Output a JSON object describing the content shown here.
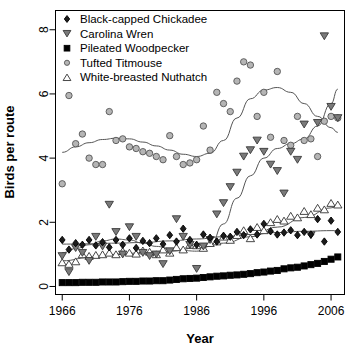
{
  "chart_data": {
    "type": "scatter",
    "title": "",
    "xlabel": "Year",
    "ylabel": "Birds per route",
    "xlim": [
      1965,
      2008
    ],
    "ylim": [
      -0.25,
      8.6
    ],
    "xticks": [
      1966,
      1976,
      1986,
      1996,
      2006
    ],
    "xticklabels": [
      "1966",
      "1976",
      "1986",
      "1996",
      "2006"
    ],
    "yticks": [
      0,
      2,
      4,
      6,
      8
    ],
    "yticklabels": [
      "0",
      "2",
      "4",
      "6",
      "8"
    ],
    "grid": false,
    "legend_position": "top-left",
    "legend": [
      {
        "label": "Black-capped Chickadee",
        "marker": "filled-diamond",
        "color": "#1a1a1a"
      },
      {
        "label": "Carolina Wren",
        "marker": "filled-down-triangle",
        "color": "#666666"
      },
      {
        "label": "Pileated Woodpecker",
        "marker": "filled-square",
        "color": "#000000"
      },
      {
        "label": "Tufted Titmouse",
        "marker": "open-circle",
        "color": "#9a9a9a"
      },
      {
        "label": "White-breasted Nuthatch",
        "marker": "open-up-triangle",
        "color": "#ffffff"
      }
    ],
    "series": [
      {
        "name": "Black-capped Chickadee",
        "marker": "filled-diamond",
        "fill": "#1c1c1c",
        "stroke": "#000000",
        "x": [
          1966,
          1967,
          1968,
          1969,
          1970,
          1971,
          1972,
          1973,
          1974,
          1975,
          1976,
          1977,
          1978,
          1979,
          1980,
          1981,
          1982,
          1983,
          1984,
          1985,
          1986,
          1987,
          1988,
          1989,
          1990,
          1991,
          1992,
          1993,
          1994,
          1995,
          1996,
          1997,
          1998,
          1999,
          2000,
          2001,
          2002,
          2003,
          2004,
          2005,
          2006,
          2007
        ],
        "y": [
          1.45,
          1.15,
          1.35,
          1.3,
          1.45,
          1.28,
          1.38,
          1.22,
          1.45,
          1.3,
          1.5,
          1.2,
          1.42,
          1.35,
          1.5,
          1.32,
          1.6,
          1.4,
          1.8,
          1.45,
          1.3,
          1.62,
          1.52,
          1.4,
          1.58,
          1.55,
          1.7,
          1.6,
          1.78,
          1.62,
          1.95,
          1.72,
          1.62,
          1.68,
          1.75,
          1.6,
          1.7,
          1.62,
          2.1,
          1.4,
          2.05,
          1.7
        ]
      },
      {
        "name": "Carolina Wren",
        "marker": "filled-down-triangle",
        "fill": "#7a7a7a",
        "stroke": "#3a3a3a",
        "x": [
          1966,
          1967,
          1968,
          1969,
          1970,
          1971,
          1972,
          1973,
          1974,
          1975,
          1976,
          1977,
          1978,
          1979,
          1980,
          1981,
          1982,
          1983,
          1984,
          1985,
          1986,
          1987,
          1988,
          1989,
          1990,
          1991,
          1992,
          1993,
          1994,
          1995,
          1996,
          1997,
          1998,
          1999,
          2000,
          2001,
          2002,
          2003,
          2004,
          2005,
          2006,
          2007
        ],
        "y": [
          0.95,
          0.45,
          1.2,
          1.05,
          0.8,
          1.55,
          1.25,
          2.55,
          1.7,
          1.0,
          1.85,
          1.55,
          1.05,
          0.95,
          1.0,
          0.7,
          1.1,
          2.1,
          1.55,
          1.3,
          0.55,
          1.25,
          1.45,
          2.25,
          2.6,
          3.1,
          3.55,
          4.05,
          4.25,
          4.55,
          4.2,
          3.8,
          3.6,
          2.9,
          4.2,
          3.95,
          5.05,
          1.6,
          5.1,
          7.8,
          5.6,
          5.25
        ]
      },
      {
        "name": "Pileated Woodpecker",
        "marker": "filled-square",
        "fill": "#000000",
        "stroke": "#000000",
        "x": [
          1966,
          1967,
          1968,
          1969,
          1970,
          1971,
          1972,
          1973,
          1974,
          1975,
          1976,
          1977,
          1978,
          1979,
          1980,
          1981,
          1982,
          1983,
          1984,
          1985,
          1986,
          1987,
          1988,
          1989,
          1990,
          1991,
          1992,
          1993,
          1994,
          1995,
          1996,
          1997,
          1998,
          1999,
          2000,
          2001,
          2002,
          2003,
          2004,
          2005,
          2006,
          2007
        ],
        "y": [
          0.12,
          0.12,
          0.12,
          0.13,
          0.13,
          0.13,
          0.14,
          0.14,
          0.14,
          0.15,
          0.16,
          0.16,
          0.17,
          0.17,
          0.18,
          0.18,
          0.2,
          0.22,
          0.24,
          0.25,
          0.26,
          0.28,
          0.3,
          0.32,
          0.33,
          0.35,
          0.36,
          0.38,
          0.4,
          0.43,
          0.45,
          0.48,
          0.5,
          0.55,
          0.58,
          0.6,
          0.64,
          0.68,
          0.72,
          0.78,
          0.85,
          0.92
        ]
      },
      {
        "name": "Tufted Titmouse",
        "marker": "open-circle",
        "fill": "#b5b5b5",
        "stroke": "#555555",
        "x": [
          1966,
          1967,
          1968,
          1969,
          1970,
          1971,
          1972,
          1973,
          1974,
          1975,
          1976,
          1977,
          1978,
          1979,
          1980,
          1981,
          1982,
          1983,
          1984,
          1985,
          1986,
          1987,
          1988,
          1989,
          1990,
          1991,
          1992,
          1993,
          1994,
          1995,
          1996,
          1997,
          1998,
          1999,
          2000,
          2001,
          2002,
          2003,
          2004,
          2005,
          2006,
          2007
        ],
        "y": [
          3.2,
          5.95,
          4.45,
          4.75,
          4.0,
          3.8,
          3.8,
          5.45,
          4.55,
          4.6,
          4.35,
          4.3,
          4.2,
          4.15,
          4.05,
          3.95,
          4.7,
          4.05,
          3.8,
          3.85,
          3.95,
          5.0,
          4.25,
          6.05,
          5.7,
          5.45,
          6.4,
          7.0,
          6.9,
          5.3,
          6.05,
          4.65,
          6.7,
          4.55,
          4.4,
          5.3,
          4.55,
          4.6,
          4.05,
          5.15,
          5.3,
          5.25
        ]
      },
      {
        "name": "White-breasted Nuthatch",
        "marker": "open-up-triangle",
        "fill": "#ffffff",
        "stroke": "#333333",
        "x": [
          1966,
          1967,
          1968,
          1969,
          1970,
          1971,
          1972,
          1973,
          1974,
          1975,
          1976,
          1977,
          1978,
          1979,
          1980,
          1981,
          1982,
          1983,
          1984,
          1985,
          1986,
          1987,
          1988,
          1989,
          1990,
          1991,
          1992,
          1993,
          1994,
          1995,
          1996,
          1997,
          1998,
          1999,
          2000,
          2001,
          2002,
          2003,
          2004,
          2005,
          2006,
          2007
        ],
        "y": [
          0.75,
          0.7,
          0.78,
          1.0,
          0.95,
          0.98,
          1.0,
          1.05,
          1.0,
          1.1,
          1.05,
          1.02,
          1.12,
          1.08,
          1.0,
          1.15,
          1.05,
          1.22,
          1.15,
          1.3,
          1.28,
          1.2,
          1.35,
          1.4,
          1.55,
          1.45,
          1.6,
          1.75,
          1.5,
          1.85,
          1.75,
          2.0,
          2.1,
          2.05,
          2.2,
          2.15,
          2.35,
          2.25,
          2.45,
          2.4,
          2.6,
          2.55
        ]
      }
    ],
    "trend_lines": [
      {
        "name": "Tufted Titmouse trend",
        "stroke": "#555555",
        "points": [
          [
            1966,
            4.18
          ],
          [
            1968,
            4.35
          ],
          [
            1970,
            4.48
          ],
          [
            1972,
            4.58
          ],
          [
            1974,
            4.62
          ],
          [
            1976,
            4.6
          ],
          [
            1978,
            4.5
          ],
          [
            1980,
            4.38
          ],
          [
            1982,
            4.25
          ],
          [
            1984,
            4.12
          ],
          [
            1986,
            4.05
          ],
          [
            1988,
            4.15
          ],
          [
            1990,
            4.55
          ],
          [
            1992,
            5.25
          ],
          [
            1994,
            5.85
          ],
          [
            1996,
            6.12
          ],
          [
            1998,
            6.2
          ],
          [
            2000,
            6.05
          ],
          [
            2002,
            5.7
          ],
          [
            2004,
            5.3
          ],
          [
            2006,
            4.95
          ],
          [
            2007,
            4.8
          ]
        ]
      },
      {
        "name": "Carolina Wren trend",
        "stroke": "#555555",
        "points": [
          [
            1966,
            1.05
          ],
          [
            1968,
            1.18
          ],
          [
            1970,
            1.3
          ],
          [
            1972,
            1.42
          ],
          [
            1974,
            1.48
          ],
          [
            1976,
            1.45
          ],
          [
            1978,
            1.35
          ],
          [
            1980,
            1.25
          ],
          [
            1982,
            1.18
          ],
          [
            1984,
            1.12
          ],
          [
            1986,
            1.1
          ],
          [
            1988,
            1.25
          ],
          [
            1990,
            1.95
          ],
          [
            1992,
            2.75
          ],
          [
            1994,
            3.45
          ],
          [
            1996,
            4.0
          ],
          [
            1998,
            4.3
          ],
          [
            2000,
            4.45
          ],
          [
            2002,
            4.6
          ],
          [
            2004,
            5.0
          ],
          [
            2006,
            5.7
          ],
          [
            2007,
            6.15
          ]
        ]
      },
      {
        "name": "Black-capped Chickadee trend",
        "stroke": "#555555",
        "points": [
          [
            1966,
            1.32
          ],
          [
            1970,
            1.33
          ],
          [
            1974,
            1.35
          ],
          [
            1978,
            1.37
          ],
          [
            1982,
            1.42
          ],
          [
            1986,
            1.48
          ],
          [
            1990,
            1.55
          ],
          [
            1994,
            1.62
          ],
          [
            1998,
            1.68
          ],
          [
            2002,
            1.72
          ],
          [
            2006,
            1.74
          ],
          [
            2007,
            1.74
          ]
        ]
      },
      {
        "name": "White-breasted Nuthatch trend",
        "stroke": "#555555",
        "points": [
          [
            1966,
            0.8
          ],
          [
            1970,
            0.9
          ],
          [
            1974,
            1.0
          ],
          [
            1978,
            1.05
          ],
          [
            1982,
            1.1
          ],
          [
            1986,
            1.2
          ],
          [
            1990,
            1.35
          ],
          [
            1994,
            1.55
          ],
          [
            1998,
            1.85
          ],
          [
            2002,
            2.15
          ],
          [
            2006,
            2.45
          ],
          [
            2007,
            2.52
          ]
        ]
      }
    ]
  }
}
